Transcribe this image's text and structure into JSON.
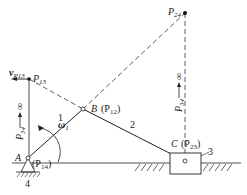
{
  "diagram": {
    "type": "mechanism-instant-centers",
    "labels": {
      "P24": "P",
      "P24_sub": "24",
      "P13": "P",
      "P13_sub": "13",
      "vP13": "v",
      "vP13_sub": "P13",
      "B": "B",
      "P12": "(P",
      "P12_sub": "12",
      "P12_close": ")",
      "C": "C",
      "P23": "(P",
      "P23_sub": "23",
      "P23_close": ")",
      "A": "A",
      "P14": "(P",
      "P14_sub": "14",
      "P14_close": ")",
      "omega": "ω",
      "omega_sub": "1",
      "link1": "1",
      "link2": "2",
      "link3": "3",
      "link4": "4",
      "P34_left": "P",
      "P34_left_sub": "34",
      "P34_right": "P",
      "P34_right_sub": "34",
      "infinity": "∞"
    },
    "colors": {
      "line": "#222222",
      "background": "#ffffff"
    }
  }
}
